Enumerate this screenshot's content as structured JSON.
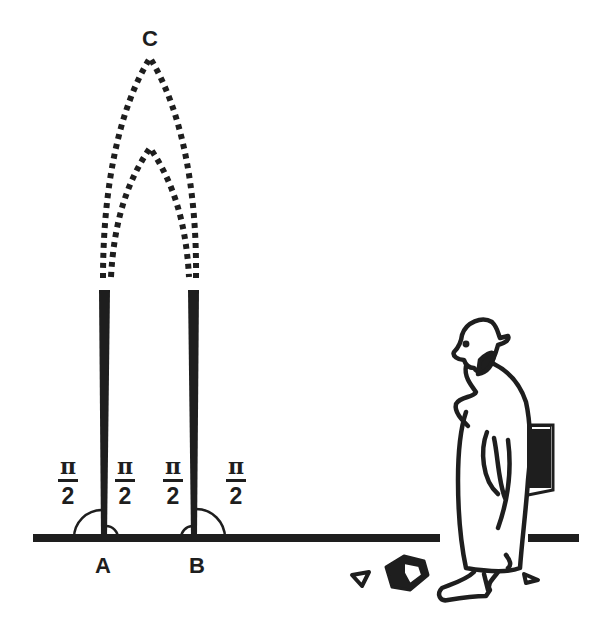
{
  "diagram": {
    "colors": {
      "ink": "#1e1e1e",
      "background": "#ffffff"
    },
    "points": {
      "A": {
        "label": "A",
        "x": 104,
        "y": 538
      },
      "B": {
        "label": "B",
        "x": 194,
        "y": 538
      },
      "C": {
        "label": "C",
        "x": 150,
        "y": 58
      }
    },
    "angle_labels": [
      {
        "id": "A-left",
        "numerator": "π",
        "denominator": "2",
        "x": 68
      },
      {
        "id": "A-right",
        "numerator": "π",
        "denominator": "2",
        "x": 125
      },
      {
        "id": "B-left",
        "numerator": "π",
        "denominator": "2",
        "x": 173
      },
      {
        "id": "B-right",
        "numerator": "π",
        "denominator": "2",
        "x": 236
      }
    ],
    "figure": {
      "name": "thinker",
      "holds": "book"
    }
  }
}
